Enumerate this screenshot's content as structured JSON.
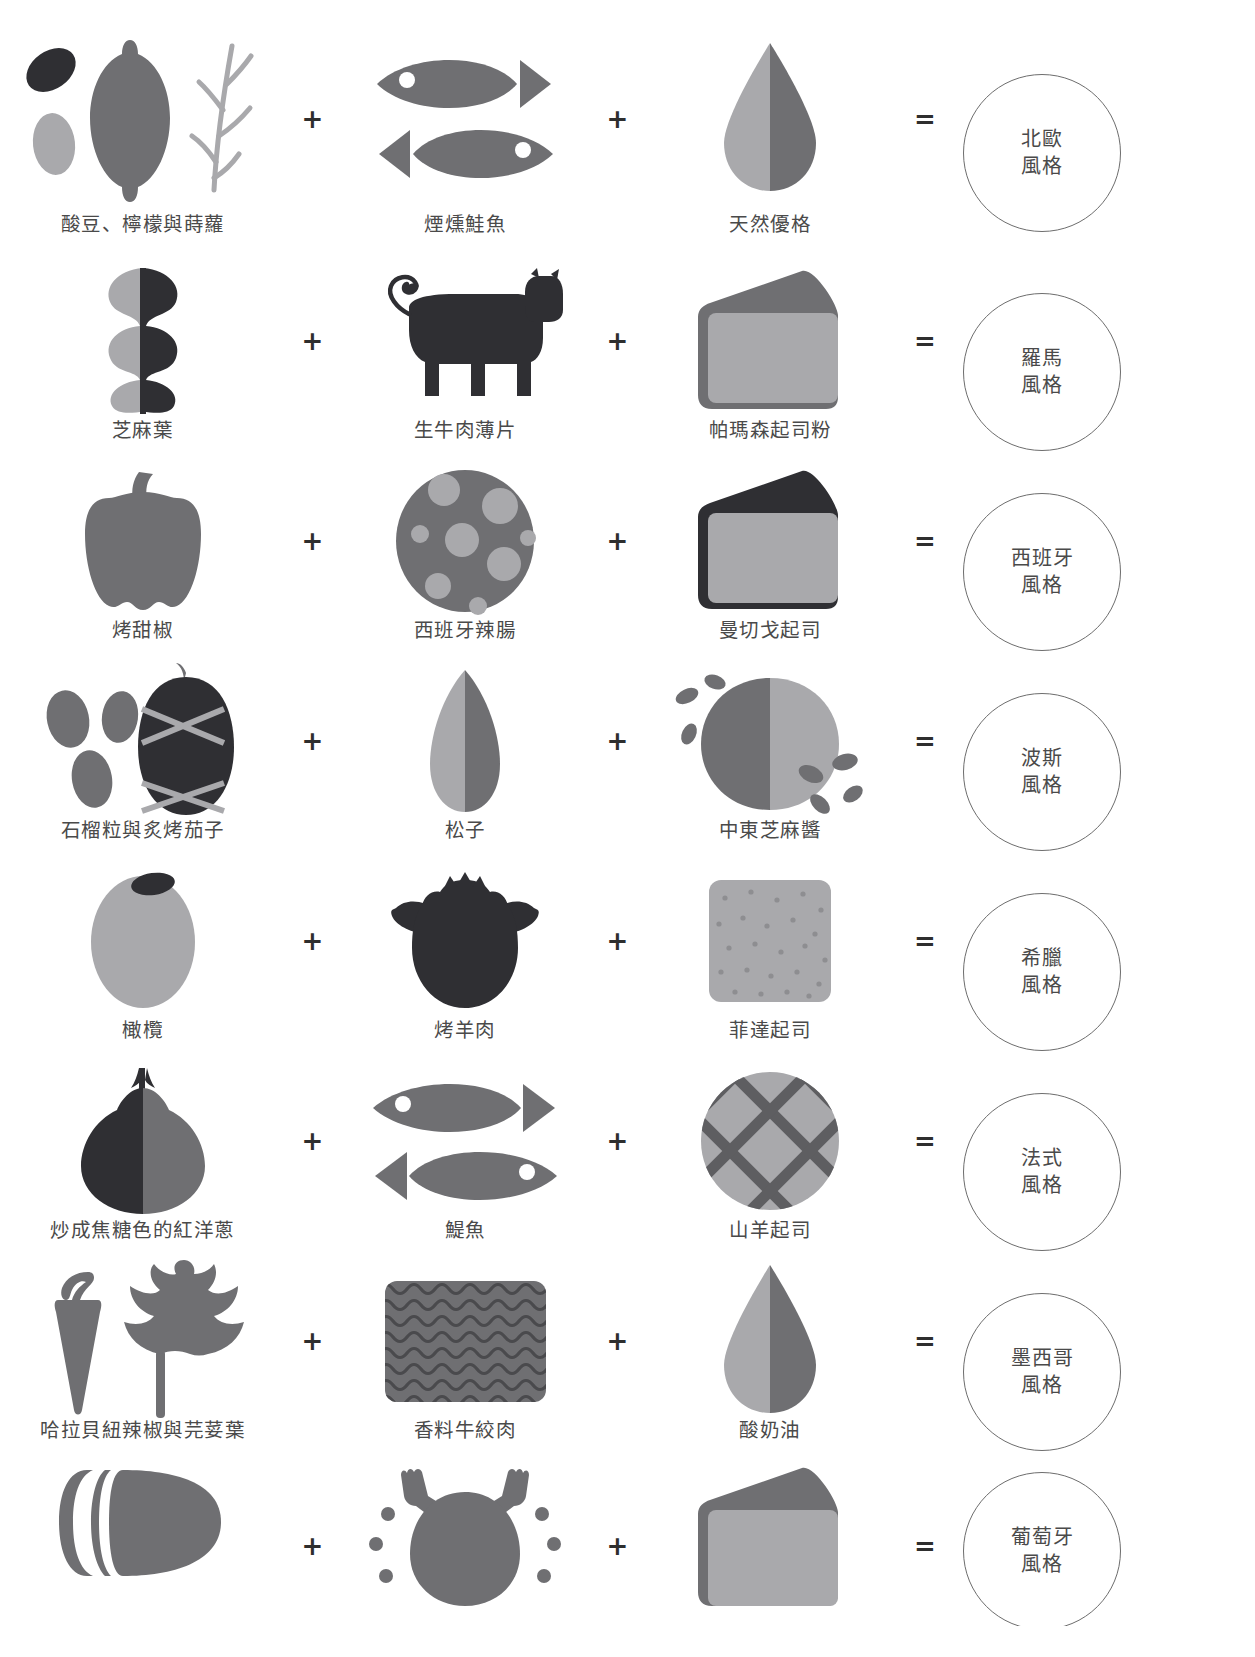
{
  "page": {
    "plus_symbol": "+",
    "equals_symbol": "=",
    "colors": {
      "dark": "#2f2f33",
      "mid": "#6f6f72",
      "light": "#a9a9ac",
      "outline": "#6d6d6d",
      "text": "#4a4a4a",
      "background": "#ffffff"
    }
  },
  "rows": [
    {
      "ingredients": [
        {
          "label": "酸豆、檸檬與蒔蘿",
          "icon": "capers-lemon-dill-icon"
        },
        {
          "label": "煙燻鮭魚",
          "icon": "smoked-salmon-icon"
        },
        {
          "label": "天然優格",
          "icon": "plain-yogurt-drop-icon"
        }
      ],
      "result": {
        "line1": "北歐",
        "line2": "風格"
      }
    },
    {
      "ingredients": [
        {
          "label": "芝麻葉",
          "icon": "arugula-leaf-icon"
        },
        {
          "label": "生牛肉薄片",
          "icon": "beef-carpaccio-cow-icon"
        },
        {
          "label": "帕瑪森起司粉",
          "icon": "parmesan-wedge-icon"
        }
      ],
      "result": {
        "line1": "羅馬",
        "line2": "風格"
      }
    },
    {
      "ingredients": [
        {
          "label": "烤甜椒",
          "icon": "roasted-bell-pepper-icon"
        },
        {
          "label": "西班牙辣腸",
          "icon": "chorizo-slice-icon"
        },
        {
          "label": "曼切戈起司",
          "icon": "manchego-wedge-icon"
        }
      ],
      "result": {
        "line1": "西班牙",
        "line2": "風格"
      }
    },
    {
      "ingredients": [
        {
          "label": "石榴粒與炙烤茄子",
          "icon": "pomegranate-eggplant-icon"
        },
        {
          "label": "松子",
          "icon": "pine-nut-icon"
        },
        {
          "label": "中東芝麻醬",
          "icon": "tahini-sesame-icon"
        }
      ],
      "result": {
        "line1": "波斯",
        "line2": "風格"
      }
    },
    {
      "ingredients": [
        {
          "label": "橄欖",
          "icon": "olive-icon"
        },
        {
          "label": "烤羊肉",
          "icon": "roast-lamb-sheep-icon"
        },
        {
          "label": "菲達起司",
          "icon": "feta-cheese-block-icon"
        }
      ],
      "result": {
        "line1": "希臘",
        "line2": "風格"
      }
    },
    {
      "ingredients": [
        {
          "label": "炒成焦糖色的紅洋蔥",
          "icon": "caramelized-red-onion-icon"
        },
        {
          "label": "鯷魚",
          "icon": "anchovy-fish-icon"
        },
        {
          "label": "山羊起司",
          "icon": "goat-cheese-round-icon"
        }
      ],
      "result": {
        "line1": "法式",
        "line2": "風格"
      }
    },
    {
      "ingredients": [
        {
          "label": "哈拉貝紐辣椒與芫荽葉",
          "icon": "jalapeno-cilantro-icon"
        },
        {
          "label": "香料牛絞肉",
          "icon": "spiced-ground-beef-icon"
        },
        {
          "label": "酸奶油",
          "icon": "sour-cream-drop-icon"
        }
      ],
      "result": {
        "line1": "墨西哥",
        "line2": "風格"
      }
    },
    {
      "ingredients": [
        {
          "label": "",
          "icon": "chorizo-sausage-icon"
        },
        {
          "label": "",
          "icon": "grilled-chicken-icon"
        },
        {
          "label": "",
          "icon": "cheese-wedge-icon"
        }
      ],
      "result": {
        "line1": "葡萄牙",
        "line2": "風格"
      }
    }
  ]
}
